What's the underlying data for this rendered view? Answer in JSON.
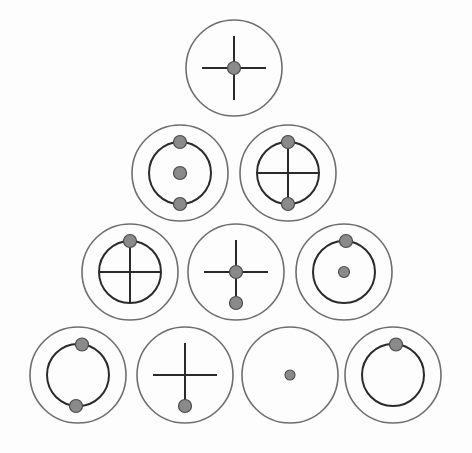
{
  "document": {
    "title": "Orbital Diagram Pyramid",
    "background_color": "#fdfdfd",
    "width": 472,
    "height": 453
  },
  "style": {
    "outer_circle_color": "#6e6e6e",
    "inner_circle_color": "#2a2a2a",
    "line_color": "#2a2a2a",
    "dot_fill_color": "#8a8a8a",
    "dot_stroke_color": "#4a4a4a"
  },
  "diagram": {
    "type": "pyramid-of-orbital-circles",
    "rows": [
      {
        "index": 1,
        "count": 1
      },
      {
        "index": 2,
        "count": 2
      },
      {
        "index": 3,
        "count": 3
      },
      {
        "index": 4,
        "count": 4
      }
    ],
    "total_figures": 10
  },
  "figures": [
    {
      "id": "figure-1",
      "row": 1,
      "column": 1,
      "label": "cross-with-center-dot",
      "cx": 234,
      "cy": 68,
      "outer_r": 48,
      "inner_r": null,
      "cross": {
        "present": true,
        "h_half": 32,
        "v_half": 32,
        "mode": "free"
      },
      "dots": [
        {
          "name": "center-dot",
          "dx": 0,
          "dy": 0,
          "r": 6.5
        }
      ]
    },
    {
      "id": "figure-2",
      "row": 2,
      "column": 1,
      "label": "inner-ring-with-center-and-two-pole-dots",
      "cx": 180,
      "cy": 173,
      "outer_r": 48,
      "inner_r": 31,
      "cross": {
        "present": false,
        "h_half": 0,
        "v_half": 0,
        "mode": "none"
      },
      "dots": [
        {
          "name": "top-dot",
          "dx": 0,
          "dy": -31,
          "r": 6.5
        },
        {
          "name": "center-dot",
          "dx": 0,
          "dy": 0,
          "r": 6.5
        },
        {
          "name": "bottom-dot",
          "dx": 0,
          "dy": 31,
          "r": 6.5
        }
      ]
    },
    {
      "id": "figure-3",
      "row": 2,
      "column": 2,
      "label": "inner-ring-with-cross-and-two-pole-dots",
      "cx": 288,
      "cy": 173,
      "outer_r": 48,
      "inner_r": 31,
      "cross": {
        "present": true,
        "h_half": 31,
        "v_half": 31,
        "mode": "inscribed"
      },
      "dots": [
        {
          "name": "top-dot",
          "dx": 0,
          "dy": -31,
          "r": 6.5
        },
        {
          "name": "bottom-dot",
          "dx": 0,
          "dy": 31,
          "r": 6.5
        }
      ]
    },
    {
      "id": "figure-4",
      "row": 3,
      "column": 1,
      "label": "inner-ring-with-cross-and-top-dot",
      "cx": 130,
      "cy": 272,
      "outer_r": 48,
      "inner_r": 31,
      "cross": {
        "present": true,
        "h_half": 31,
        "v_half": 31,
        "mode": "inscribed"
      },
      "dots": [
        {
          "name": "top-dot",
          "dx": 0,
          "dy": -31,
          "r": 6.5
        }
      ]
    },
    {
      "id": "figure-5",
      "row": 3,
      "column": 2,
      "label": "cross-with-center-dot-and-lower-dot",
      "cx": 236,
      "cy": 272,
      "outer_r": 48,
      "inner_r": null,
      "cross": {
        "present": true,
        "h_half": 32,
        "v_half": 32,
        "mode": "free"
      },
      "dots": [
        {
          "name": "center-dot",
          "dx": 0,
          "dy": 0,
          "r": 6.5
        },
        {
          "name": "lower-dot",
          "dx": 0,
          "dy": 31,
          "r": 6.5
        }
      ]
    },
    {
      "id": "figure-6",
      "row": 3,
      "column": 3,
      "label": "inner-ring-with-top-dot-and-center-dot",
      "cx": 344,
      "cy": 272,
      "outer_r": 48,
      "inner_r": 31,
      "cross": {
        "present": false,
        "h_half": 0,
        "v_half": 0,
        "mode": "none"
      },
      "dots": [
        {
          "name": "top-dot",
          "dx": 2,
          "dy": -31,
          "r": 6.5
        },
        {
          "name": "center-dot",
          "dx": 0,
          "dy": 0,
          "r": 5.5
        }
      ]
    },
    {
      "id": "figure-7",
      "row": 4,
      "column": 1,
      "label": "inner-ring-with-two-pole-dots",
      "cx": 78,
      "cy": 375,
      "outer_r": 48,
      "inner_r": 31,
      "cross": {
        "present": false,
        "h_half": 0,
        "v_half": 0,
        "mode": "none"
      },
      "dots": [
        {
          "name": "top-dot",
          "dx": 4,
          "dy": -30.5,
          "r": 6.5
        },
        {
          "name": "bottom-dot",
          "dx": -2,
          "dy": 31,
          "r": 6.5
        }
      ]
    },
    {
      "id": "figure-8",
      "row": 4,
      "column": 2,
      "label": "cross-with-bottom-dot",
      "cx": 185,
      "cy": 375,
      "outer_r": 48,
      "inner_r": null,
      "cross": {
        "present": true,
        "h_half": 32,
        "v_half": 32,
        "mode": "free"
      },
      "dots": [
        {
          "name": "bottom-dot",
          "dx": 0,
          "dy": 31,
          "r": 6.5
        }
      ]
    },
    {
      "id": "figure-9",
      "row": 4,
      "column": 3,
      "label": "plain-circle-with-center-dot",
      "cx": 290,
      "cy": 375,
      "outer_r": 48,
      "inner_r": null,
      "cross": {
        "present": false,
        "h_half": 0,
        "v_half": 0,
        "mode": "none"
      },
      "dots": [
        {
          "name": "center-dot",
          "dx": 0,
          "dy": 0,
          "r": 5.0
        }
      ]
    },
    {
      "id": "figure-10",
      "row": 4,
      "column": 4,
      "label": "inner-ring-with-single-top-dot",
      "cx": 393,
      "cy": 375,
      "outer_r": 48,
      "inner_r": 31,
      "cross": {
        "present": false,
        "h_half": 0,
        "v_half": 0,
        "mode": "none"
      },
      "dots": [
        {
          "name": "top-dot",
          "dx": 3,
          "dy": -30.5,
          "r": 6.5
        }
      ]
    }
  ]
}
